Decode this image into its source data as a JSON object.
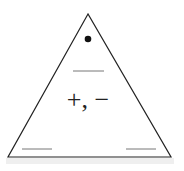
{
  "diagram": {
    "shape": "triangle",
    "top_marker": "•",
    "center_symbol": "+, −",
    "blanks": [
      "top",
      "bottom-left",
      "bottom-right"
    ],
    "colors": {
      "stroke": "#222222",
      "blank_line": "#777777",
      "shadow": "#e6e6e6"
    }
  }
}
